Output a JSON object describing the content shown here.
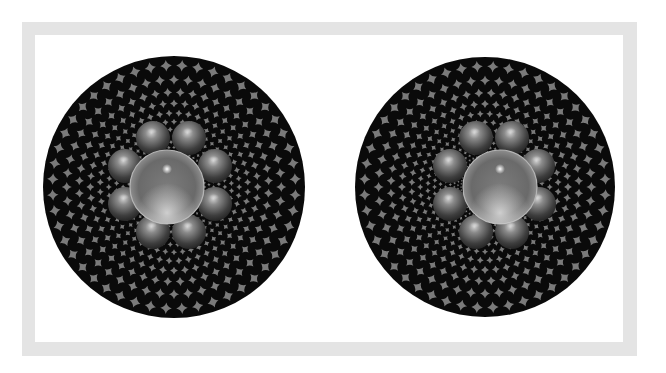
{
  "frame": {
    "border_color": "#e4e4e4",
    "background": "#ffffff"
  },
  "illusion": {
    "disc_background": "#0a0a0a",
    "tile_color": "#7a7a7a",
    "spiral_arms": 48,
    "rings": 15,
    "panels": [
      {
        "name": "left-panel",
        "disc": {
          "cx": 174,
          "cy": 187,
          "r": 131
        },
        "center_sphere": {
          "cx": 167,
          "cy": 187,
          "r": 37
        },
        "small_spheres": [
          {
            "cx": 153,
            "cy": 138
          },
          {
            "cx": 189,
            "cy": 138
          },
          {
            "cx": 125,
            "cy": 166
          },
          {
            "cx": 215,
            "cy": 166
          },
          {
            "cx": 125,
            "cy": 204
          },
          {
            "cx": 215,
            "cy": 204
          },
          {
            "cx": 153,
            "cy": 232
          },
          {
            "cx": 189,
            "cy": 232
          }
        ]
      },
      {
        "name": "right-panel",
        "disc": {
          "cx": 485,
          "cy": 187,
          "r": 130
        },
        "center_sphere": {
          "cx": 500,
          "cy": 187,
          "r": 37
        },
        "small_spheres": [
          {
            "cx": 476,
            "cy": 138
          },
          {
            "cx": 512,
            "cy": 138
          },
          {
            "cx": 450,
            "cy": 166
          },
          {
            "cx": 538,
            "cy": 166
          },
          {
            "cx": 450,
            "cy": 204
          },
          {
            "cx": 539,
            "cy": 204
          },
          {
            "cx": 476,
            "cy": 232
          },
          {
            "cx": 512,
            "cy": 232
          }
        ]
      }
    ],
    "small_sphere_radius": 17
  }
}
